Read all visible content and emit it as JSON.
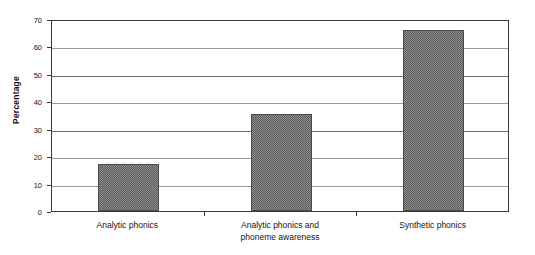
{
  "chart_data": {
    "type": "bar",
    "title": "",
    "xlabel": "",
    "ylabel": "Percentage",
    "categories": [
      "Analytic phonics",
      "Analytic phonics and\nphoneme awareness",
      "Synthetic phonics"
    ],
    "values": [
      17,
      35.5,
      66
    ],
    "ylim": [
      0,
      70
    ],
    "yticks": [
      0,
      10,
      20,
      30,
      40,
      50,
      60,
      70
    ],
    "ytick_labels": [
      "0",
      "10",
      "20",
      "30",
      "40",
      "50",
      "60",
      "70"
    ],
    "grid": true,
    "legend": false,
    "bar_color": "#7a7a7a",
    "bar_edge_color": "#4a4a4a",
    "axis_color": "#3a3a3a",
    "gridline_color": "#9a9a9a",
    "background_color": "#ffffff"
  }
}
